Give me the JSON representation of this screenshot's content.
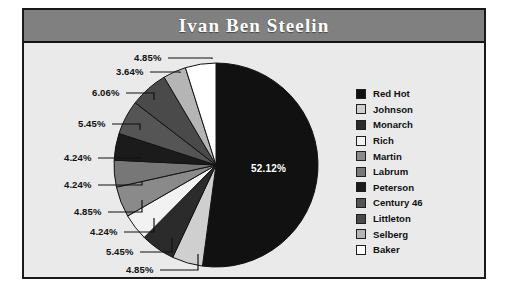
{
  "title": "Ivan Ben Steelin",
  "colors": {
    "title_bar": "#808080",
    "title_text": "#ffffff",
    "plot_background": "#eaeaea",
    "border": "#1a1a1a"
  },
  "chart_data": {
    "type": "pie",
    "title": "Ivan Ben Steelin",
    "xlabel": "",
    "ylabel": "",
    "legend_position": "right",
    "grid": false,
    "start_angle_deg": 90,
    "direction": "clockwise",
    "labels": [
      "Red Hot",
      "Johnson",
      "Monarch",
      "Rich",
      "Martin",
      "Labrum",
      "Peterson",
      "Century 46",
      "Littleton",
      "Selberg",
      "Baker"
    ],
    "values": [
      52.12,
      4.85,
      5.45,
      4.24,
      4.85,
      4.24,
      4.24,
      5.45,
      6.06,
      3.64,
      4.85
    ],
    "value_labels": [
      "52.12%",
      "4.85%",
      "5.45%",
      "4.24%",
      "4.85%",
      "4.24%",
      "4.24%",
      "5.45%",
      "6.06%",
      "3.64%",
      "4.85%"
    ],
    "slice_colors": [
      "#111111",
      "#cfcfcf",
      "#2b2b2b",
      "#f2f2f2",
      "#8a8a8a",
      "#777777",
      "#1b1b1b",
      "#555555",
      "#4a4a4a",
      "#b5b5b5",
      "#ffffff"
    ],
    "units": "percent"
  },
  "legend": {
    "items": [
      {
        "label": "Red Hot",
        "color": "#111111"
      },
      {
        "label": "Johnson",
        "color": "#cfcfcf"
      },
      {
        "label": "Monarch",
        "color": "#2b2b2b"
      },
      {
        "label": "Rich",
        "color": "#f2f2f2"
      },
      {
        "label": "Martin",
        "color": "#8a8a8a"
      },
      {
        "label": "Labrum",
        "color": "#777777"
      },
      {
        "label": "Peterson",
        "color": "#1b1b1b"
      },
      {
        "label": "Century 46",
        "color": "#555555"
      },
      {
        "label": "Littleton",
        "color": "#4a4a4a"
      },
      {
        "label": "Selberg",
        "color": "#b5b5b5"
      },
      {
        "label": "Baker",
        "color": "#ffffff"
      }
    ]
  }
}
